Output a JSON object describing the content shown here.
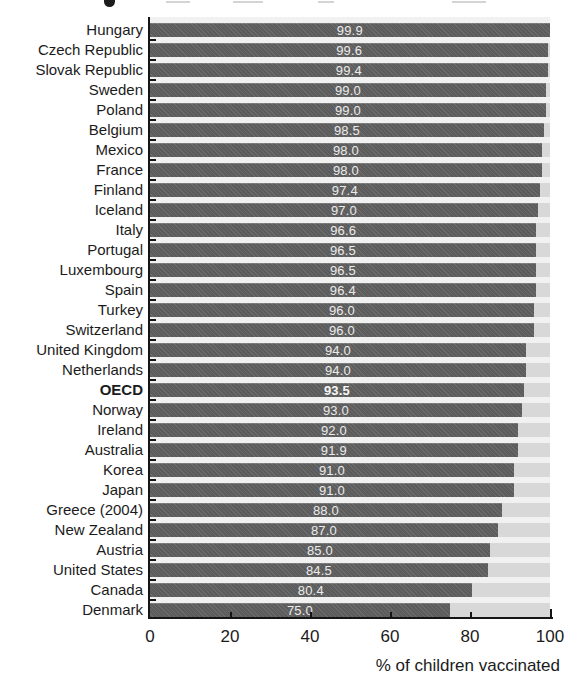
{
  "chart_data": {
    "type": "bar",
    "orientation": "horizontal",
    "title": "",
    "xlabel": "% of children vaccinated",
    "xlim": [
      0,
      100
    ],
    "xticks": [
      0,
      20,
      40,
      60,
      80,
      100
    ],
    "grid": false,
    "legend": "none",
    "emphasized_category": "OECD",
    "categories": [
      "Hungary",
      "Czech Republic",
      "Slovak Republic",
      "Sweden",
      "Poland",
      "Belgium",
      "Mexico",
      "France",
      "Finland",
      "Iceland",
      "Italy",
      "Portugal",
      "Luxembourg",
      "Spain",
      "Turkey",
      "Switzerland",
      "United Kingdom",
      "Netherlands",
      "OECD",
      "Norway",
      "Ireland",
      "Australia",
      "Korea",
      "Japan",
      "Greece (2004)",
      "New Zealand",
      "Austria",
      "United States",
      "Canada",
      "Denmark"
    ],
    "values": [
      99.9,
      99.6,
      99.4,
      99.0,
      99.0,
      98.5,
      98.0,
      98.0,
      97.4,
      97.0,
      96.6,
      96.5,
      96.5,
      96.4,
      96.0,
      96.0,
      94.0,
      94.0,
      93.5,
      93.0,
      92.0,
      91.9,
      91.0,
      91.0,
      88.0,
      87.0,
      85.0,
      84.5,
      80.4,
      75.0
    ],
    "value_labels": [
      "99.9",
      "99.6",
      "99.4",
      "99.0",
      "99.0",
      "98.5",
      "98.0",
      "98.0",
      "97.4",
      "97.0",
      "96.6",
      "96.5",
      "96.5",
      "96.4",
      "96.0",
      "96.0",
      "94.0",
      "94.0",
      "93.5",
      "93.0",
      "92.0",
      "91.9",
      "91.0",
      "91.0",
      "88.0",
      "87.0",
      "85.0",
      "84.5",
      "80.4",
      "75.0"
    ],
    "colors": {
      "bar": "#5f5f5f",
      "track": "#d8d8d8",
      "plot_background": "#f1f1f1",
      "axis": "#151515",
      "value_text": "#ebebeb",
      "label_text": "#1b1b1b"
    }
  }
}
